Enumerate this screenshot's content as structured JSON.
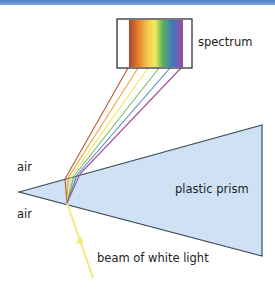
{
  "diagram": {
    "labels": {
      "spectrum": "spectrum",
      "air_top": "air",
      "air_bottom": "air",
      "prism": "plastic prism",
      "beam": "beam of white light"
    },
    "colors": {
      "prism_fill": "#cfe2f5",
      "prism_edge": "#3a4a55",
      "beam": "#f2ea7a",
      "header_bar": "#5a8ac8"
    },
    "spectrum_colors": [
      "#b5572a",
      "#f0a040",
      "#f5e050",
      "#6fbf5a",
      "#4f86c6",
      "#a24fa0"
    ]
  }
}
